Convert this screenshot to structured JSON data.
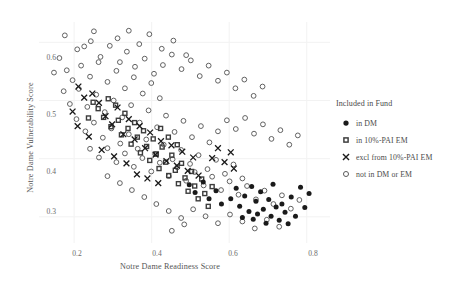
{
  "chart_data": {
    "type": "scatter",
    "title": "",
    "xlabel": "Notre Dame Readiness Score",
    "ylabel": "Notre Dame Vulnerability Score",
    "xlim": [
      0.13,
      0.86
    ],
    "ylim": [
      0.255,
      0.635
    ],
    "xticks": [
      0.2,
      0.4,
      0.6,
      0.8
    ],
    "xtick_labels": [
      "0.2",
      "0.4",
      "0.6",
      "0.8"
    ],
    "yticks": [
      0.3,
      0.4,
      0.5,
      0.6
    ],
    "ytick_labels": [
      "0.3",
      "0.4",
      "0.5",
      "0.6"
    ],
    "grid": true,
    "grid_color": "#f2f2f2",
    "background": "#ffffff",
    "legend_position": "right",
    "legend_title": "Included in Fund",
    "series": [
      {
        "name": "in DM",
        "marker": "filled-circle",
        "color": "#1a1a1a",
        "points": [
          [
            0.604,
            0.331
          ],
          [
            0.618,
            0.349
          ],
          [
            0.627,
            0.318
          ],
          [
            0.634,
            0.299
          ],
          [
            0.64,
            0.336
          ],
          [
            0.651,
            0.309
          ],
          [
            0.658,
            0.352
          ],
          [
            0.662,
            0.296
          ],
          [
            0.669,
            0.327
          ],
          [
            0.673,
            0.305
          ],
          [
            0.681,
            0.343
          ],
          [
            0.688,
            0.313
          ],
          [
            0.695,
            0.289
          ],
          [
            0.702,
            0.33
          ],
          [
            0.708,
            0.301
          ],
          [
            0.713,
            0.356
          ],
          [
            0.721,
            0.317
          ],
          [
            0.729,
            0.294
          ],
          [
            0.736,
            0.322
          ],
          [
            0.744,
            0.308
          ],
          [
            0.752,
            0.288
          ],
          [
            0.76,
            0.334
          ],
          [
            0.771,
            0.301
          ],
          [
            0.784,
            0.351
          ],
          [
            0.795,
            0.316
          ],
          [
            0.806,
            0.34
          ],
          [
            0.566,
            0.345
          ],
          [
            0.58,
            0.322
          ],
          [
            0.548,
            0.331
          ],
          [
            0.533,
            0.36
          ],
          [
            0.512,
            0.342
          ],
          [
            0.497,
            0.355
          ]
        ]
      },
      {
        "name": "in 10%-PAI EM",
        "marker": "filled-square",
        "color": "#3d3d3d",
        "points": [
          [
            0.262,
            0.486
          ],
          [
            0.276,
            0.471
          ],
          [
            0.288,
            0.503
          ],
          [
            0.295,
            0.455
          ],
          [
            0.307,
            0.492
          ],
          [
            0.314,
            0.466
          ],
          [
            0.322,
            0.441
          ],
          [
            0.331,
            0.478
          ],
          [
            0.339,
            0.452
          ],
          [
            0.347,
            0.425
          ],
          [
            0.356,
            0.462
          ],
          [
            0.363,
            0.437
          ],
          [
            0.371,
            0.41
          ],
          [
            0.379,
            0.448
          ],
          [
            0.387,
            0.421
          ],
          [
            0.395,
            0.397
          ],
          [
            0.404,
            0.434
          ],
          [
            0.412,
            0.408
          ],
          [
            0.419,
            0.383
          ],
          [
            0.427,
            0.42
          ],
          [
            0.436,
            0.394
          ],
          [
            0.444,
            0.371
          ],
          [
            0.452,
            0.406
          ],
          [
            0.461,
            0.38
          ],
          [
            0.469,
            0.357
          ],
          [
            0.477,
            0.392
          ],
          [
            0.486,
            0.367
          ],
          [
            0.494,
            0.344
          ],
          [
            0.503,
            0.378
          ],
          [
            0.511,
            0.353
          ],
          [
            0.52,
            0.331
          ],
          [
            0.529,
            0.365
          ],
          [
            0.537,
            0.34
          ],
          [
            0.546,
            0.318
          ],
          [
            0.556,
            0.352
          ],
          [
            0.423,
            0.452
          ],
          [
            0.443,
            0.437
          ],
          [
            0.466,
            0.424
          ],
          [
            0.237,
            0.47
          ],
          [
            0.249,
            0.497
          ]
        ]
      },
      {
        "name": "excl from 10%-PAI EM",
        "marker": "cross",
        "color": "#1a1a1a",
        "points": [
          [
            0.247,
            0.512
          ],
          [
            0.264,
            0.496
          ],
          [
            0.281,
            0.473
          ],
          [
            0.298,
            0.459
          ],
          [
            0.312,
            0.488
          ],
          [
            0.327,
            0.442
          ],
          [
            0.341,
            0.468
          ],
          [
            0.356,
            0.433
          ],
          [
            0.369,
            0.456
          ],
          [
            0.383,
            0.418
          ],
          [
            0.396,
            0.445
          ],
          [
            0.41,
            0.407
          ],
          [
            0.424,
            0.43
          ],
          [
            0.438,
            0.396
          ],
          [
            0.451,
            0.423
          ],
          [
            0.465,
            0.388
          ],
          [
            0.479,
            0.412
          ],
          [
            0.493,
            0.379
          ],
          [
            0.507,
            0.402
          ],
          [
            0.521,
            0.371
          ],
          [
            0.211,
            0.524
          ],
          [
            0.226,
            0.505
          ],
          [
            0.196,
            0.481
          ],
          [
            0.209,
            0.456
          ],
          [
            0.238,
            0.438
          ],
          [
            0.271,
            0.415
          ],
          [
            0.303,
            0.404
          ],
          [
            0.335,
            0.392
          ],
          [
            0.556,
            0.401
          ],
          [
            0.571,
            0.418
          ],
          [
            0.588,
            0.394
          ],
          [
            0.604,
            0.411
          ],
          [
            0.612,
            0.383
          ],
          [
            0.362,
            0.373
          ],
          [
            0.389,
            0.366
          ],
          [
            0.417,
            0.358
          ]
        ]
      },
      {
        "name": "not in DM or EM",
        "marker": "open-circle",
        "color": "#5a5a5a",
        "points": [
          [
            0.176,
            0.612
          ],
          [
            0.208,
            0.588
          ],
          [
            0.243,
            0.602
          ],
          [
            0.268,
            0.575
          ],
          [
            0.292,
            0.594
          ],
          [
            0.318,
            0.566
          ],
          [
            0.336,
            0.584
          ],
          [
            0.357,
            0.558
          ],
          [
            0.382,
            0.572
          ],
          [
            0.406,
            0.546
          ],
          [
            0.218,
            0.56
          ],
          [
            0.241,
            0.541
          ],
          [
            0.263,
            0.566
          ],
          [
            0.286,
            0.532
          ],
          [
            0.309,
            0.551
          ],
          [
            0.331,
            0.521
          ],
          [
            0.354,
            0.54
          ],
          [
            0.377,
            0.512
          ],
          [
            0.399,
            0.53
          ],
          [
            0.421,
            0.504
          ],
          [
            0.196,
            0.535
          ],
          [
            0.173,
            0.516
          ],
          [
            0.189,
            0.494
          ],
          [
            0.212,
            0.52
          ],
          [
            0.234,
            0.489
          ],
          [
            0.257,
            0.51
          ],
          [
            0.279,
            0.48
          ],
          [
            0.302,
            0.5
          ],
          [
            0.324,
            0.471
          ],
          [
            0.347,
            0.492
          ],
          [
            0.369,
            0.462
          ],
          [
            0.392,
            0.483
          ],
          [
            0.414,
            0.454
          ],
          [
            0.437,
            0.474
          ],
          [
            0.459,
            0.446
          ],
          [
            0.482,
            0.465
          ],
          [
            0.504,
            0.437
          ],
          [
            0.527,
            0.456
          ],
          [
            0.549,
            0.428
          ],
          [
            0.571,
            0.447
          ],
          [
            0.206,
            0.468
          ],
          [
            0.229,
            0.447
          ],
          [
            0.251,
            0.462
          ],
          [
            0.274,
            0.436
          ],
          [
            0.296,
            0.452
          ],
          [
            0.319,
            0.426
          ],
          [
            0.341,
            0.442
          ],
          [
            0.364,
            0.417
          ],
          [
            0.386,
            0.433
          ],
          [
            0.409,
            0.408
          ],
          [
            0.431,
            0.424
          ],
          [
            0.454,
            0.399
          ],
          [
            0.476,
            0.415
          ],
          [
            0.499,
            0.391
          ],
          [
            0.521,
            0.406
          ],
          [
            0.544,
            0.382
          ],
          [
            0.566,
            0.398
          ],
          [
            0.589,
            0.374
          ],
          [
            0.611,
            0.39
          ],
          [
            0.634,
            0.366
          ],
          [
            0.241,
            0.417
          ],
          [
            0.264,
            0.402
          ],
          [
            0.286,
            0.418
          ],
          [
            0.309,
            0.394
          ],
          [
            0.331,
            0.409
          ],
          [
            0.354,
            0.386
          ],
          [
            0.376,
            0.401
          ],
          [
            0.399,
            0.378
          ],
          [
            0.421,
            0.393
          ],
          [
            0.444,
            0.37
          ],
          [
            0.466,
            0.385
          ],
          [
            0.489,
            0.362
          ],
          [
            0.511,
            0.377
          ],
          [
            0.534,
            0.354
          ],
          [
            0.556,
            0.369
          ],
          [
            0.579,
            0.346
          ],
          [
            0.601,
            0.361
          ],
          [
            0.624,
            0.338
          ],
          [
            0.646,
            0.353
          ],
          [
            0.669,
            0.33
          ],
          [
            0.691,
            0.345
          ],
          [
            0.714,
            0.322
          ],
          [
            0.736,
            0.337
          ],
          [
            0.759,
            0.314
          ],
          [
            0.781,
            0.329
          ],
          [
            0.286,
            0.37
          ],
          [
            0.318,
            0.358
          ],
          [
            0.349,
            0.346
          ],
          [
            0.381,
            0.334
          ],
          [
            0.412,
            0.322
          ],
          [
            0.444,
            0.31
          ],
          [
            0.476,
            0.298
          ],
          [
            0.507,
            0.313
          ],
          [
            0.539,
            0.301
          ],
          [
            0.571,
            0.289
          ],
          [
            0.602,
            0.304
          ],
          [
            0.634,
            0.292
          ],
          [
            0.666,
            0.28
          ],
          [
            0.697,
            0.295
          ],
          [
            0.729,
            0.283
          ],
          [
            0.452,
            0.276
          ],
          [
            0.484,
            0.287
          ],
          [
            0.226,
            0.593
          ],
          [
            0.251,
            0.619
          ],
          [
            0.312,
            0.607
          ],
          [
            0.341,
            0.62
          ],
          [
            0.368,
            0.597
          ],
          [
            0.394,
            0.614
          ],
          [
            0.426,
            0.589
          ],
          [
            0.456,
            0.603
          ],
          [
            0.489,
            0.578
          ],
          [
            0.181,
            0.552
          ],
          [
            0.162,
            0.573
          ],
          [
            0.148,
            0.548
          ],
          [
            0.429,
            0.561
          ],
          [
            0.452,
            0.579
          ],
          [
            0.477,
            0.554
          ],
          [
            0.501,
            0.569
          ],
          [
            0.524,
            0.542
          ],
          [
            0.547,
            0.56
          ],
          [
            0.571,
            0.534
          ],
          [
            0.594,
            0.548
          ],
          [
            0.616,
            0.521
          ],
          [
            0.639,
            0.536
          ],
          [
            0.663,
            0.508
          ],
          [
            0.686,
            0.524
          ],
          [
            0.594,
            0.466
          ],
          [
            0.617,
            0.451
          ],
          [
            0.641,
            0.47
          ],
          [
            0.664,
            0.443
          ],
          [
            0.687,
            0.459
          ],
          [
            0.709,
            0.434
          ],
          [
            0.732,
            0.449
          ],
          [
            0.755,
            0.424
          ],
          [
            0.777,
            0.44
          ]
        ]
      }
    ]
  },
  "legend": {
    "title": "Included in Fund",
    "items": [
      {
        "label": "in DM",
        "marker_name": "filled-circle-marker"
      },
      {
        "label": "in 10%-PAI EM",
        "marker_name": "filled-square-marker"
      },
      {
        "label": "excl from 10%-PAI EM",
        "marker_name": "cross-marker"
      },
      {
        "label": "not in DM or EM",
        "marker_name": "open-circle-marker"
      }
    ]
  },
  "axes": {
    "x_title": "Notre Dame Readiness Score",
    "y_title": "Notre Dame Vulnerability Score",
    "x_tick_labels": [
      "0.2",
      "0.4",
      "0.6",
      "0.8"
    ],
    "y_tick_labels": [
      "0.6",
      "0.5",
      "0.4",
      "0.3"
    ]
  },
  "colors": {
    "point_dark": "#1a1a1a",
    "point_mid": "#3d3d3d",
    "point_open": "#5a5a5a",
    "grid": "#f2f2f2",
    "text": "#4a4a4a"
  }
}
